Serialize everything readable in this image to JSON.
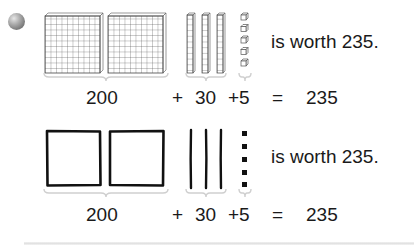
{
  "row1": {
    "style": "base-ten blocks",
    "hundreds": 2,
    "tens": 3,
    "ones": 5,
    "caption": "is worth 235.",
    "equation": {
      "hundreds_value": "200",
      "plus1": "+",
      "tens_value": "30",
      "plus2": "+5",
      "equals": "=",
      "total": "235"
    }
  },
  "row2": {
    "style": "quick pictures (squares, lines, dots)",
    "hundreds": 2,
    "tens": 3,
    "ones": 5,
    "caption": "is worth 235.",
    "equation": {
      "hundreds_value": "200",
      "plus1": "+",
      "tens_value": "30",
      "plus2": "+5",
      "equals": "=",
      "total": "235"
    }
  },
  "icons": {
    "bullet": "grey-sphere-bullet-icon"
  },
  "colors": {
    "ink": "#1a1a1a",
    "grid_line": "#555555",
    "bracket": "#d4d4d4",
    "separator": "#e2e2e2"
  }
}
